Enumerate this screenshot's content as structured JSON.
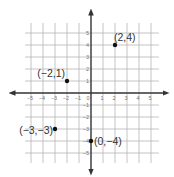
{
  "chart_data": {
    "type": "scatter",
    "title": "",
    "xlabel": "",
    "ylabel": "",
    "xlim": [
      -5,
      5
    ],
    "ylim": [
      -5,
      5
    ],
    "grid": true,
    "x_ticks": [
      -5,
      -4,
      -3,
      -2,
      -1,
      0,
      1,
      2,
      3,
      4,
      5
    ],
    "y_ticks": [
      -5,
      -4,
      -3,
      -2,
      -1,
      1,
      2,
      3,
      4,
      5
    ],
    "x_tick_labels": [
      "−5",
      "−4",
      "−3",
      "−2",
      "−1",
      "0",
      "1",
      "2",
      "3",
      "4",
      "5"
    ],
    "y_tick_labels": [
      "5",
      "4",
      "3",
      "2",
      "1",
      "−1",
      "−2",
      "−3",
      "−4",
      "−5"
    ],
    "points": [
      {
        "x": 2,
        "y": 4,
        "label": "(2,4)"
      },
      {
        "x": -2,
        "y": 1,
        "label": "(−2,1)"
      },
      {
        "x": -3,
        "y": -3,
        "label": "(−3,−3)"
      },
      {
        "x": 0,
        "y": -4,
        "label": "(0,−4)"
      }
    ]
  },
  "colors": {
    "grid": "#b5b5b5",
    "axis": "#333333",
    "point": "#111111",
    "label": "#333333",
    "tick": "#777777"
  }
}
